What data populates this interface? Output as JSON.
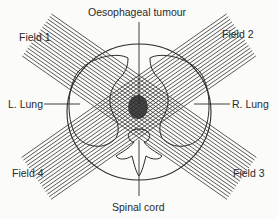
{
  "diagram": {
    "labels": {
      "tumour": "Oesophageal tumour",
      "field1": "Field 1",
      "field2": "Field 2",
      "field3": "Field 3",
      "field4": "Field 4",
      "left_lung": "L. Lung",
      "right_lung": "R. Lung",
      "spinal_cord": "Spinal cord"
    },
    "colors": {
      "ink": "#2a2a2a",
      "background": "#fbfbf9"
    }
  }
}
